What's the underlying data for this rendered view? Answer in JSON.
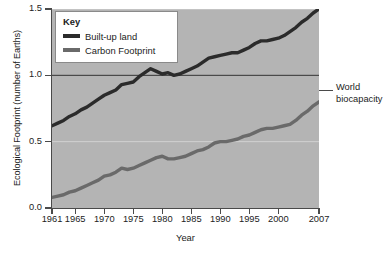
{
  "chart_data": {
    "type": "line",
    "title": "",
    "xlabel": "Year",
    "ylabel": "Ecological Footprint (number of Earths)",
    "xlim": [
      1961,
      2007
    ],
    "ylim": [
      0.0,
      1.5
    ],
    "grid": true,
    "legend_position": "top-left",
    "legend_title": "Key",
    "y_ticks": [
      "0.0",
      "0.5",
      "1.0",
      "1.5"
    ],
    "y_tick_values": [
      0.0,
      0.5,
      1.0,
      1.5
    ],
    "x_ticks": [
      "1961",
      "1965",
      "1970",
      "1975",
      "1980",
      "1985",
      "1990",
      "1995",
      "2000",
      "2007"
    ],
    "x_tick_values": [
      1961,
      1965,
      1970,
      1975,
      1980,
      1985,
      1990,
      1995,
      2000,
      2007
    ],
    "annotations": [
      {
        "text": "World biocapacity",
        "line1": "World",
        "line2": "biocapacity",
        "y_value": 1.0,
        "type": "horizontal-reference-line"
      }
    ],
    "x": [
      1961,
      1962,
      1963,
      1964,
      1965,
      1966,
      1967,
      1968,
      1969,
      1970,
      1971,
      1972,
      1973,
      1974,
      1975,
      1976,
      1977,
      1978,
      1979,
      1980,
      1981,
      1982,
      1983,
      1984,
      1985,
      1986,
      1987,
      1988,
      1989,
      1990,
      1991,
      1992,
      1993,
      1994,
      1995,
      1996,
      1997,
      1998,
      1999,
      2000,
      2001,
      2002,
      2003,
      2004,
      2005,
      2006,
      2007
    ],
    "series": [
      {
        "name": "Built-up land",
        "color": "#2b2b2b",
        "values": [
          0.62,
          0.64,
          0.66,
          0.69,
          0.71,
          0.74,
          0.76,
          0.79,
          0.82,
          0.85,
          0.87,
          0.89,
          0.93,
          0.94,
          0.95,
          0.99,
          1.02,
          1.05,
          1.03,
          1.01,
          1.02,
          1.0,
          1.01,
          1.03,
          1.05,
          1.07,
          1.1,
          1.13,
          1.14,
          1.15,
          1.16,
          1.17,
          1.17,
          1.19,
          1.21,
          1.24,
          1.26,
          1.26,
          1.27,
          1.28,
          1.3,
          1.33,
          1.36,
          1.4,
          1.43,
          1.47,
          1.5
        ]
      },
      {
        "name": "Carbon Footprint",
        "color": "#6a6a6a",
        "values": [
          0.08,
          0.09,
          0.1,
          0.12,
          0.13,
          0.15,
          0.17,
          0.19,
          0.21,
          0.24,
          0.25,
          0.27,
          0.3,
          0.29,
          0.3,
          0.32,
          0.34,
          0.36,
          0.38,
          0.39,
          0.37,
          0.37,
          0.38,
          0.39,
          0.41,
          0.43,
          0.44,
          0.46,
          0.49,
          0.5,
          0.5,
          0.51,
          0.52,
          0.54,
          0.55,
          0.57,
          0.59,
          0.6,
          0.6,
          0.61,
          0.62,
          0.63,
          0.66,
          0.7,
          0.73,
          0.77,
          0.8
        ]
      }
    ]
  },
  "axes": {
    "y_title": "Ecological Footprint (number of Earths)",
    "x_title": "Year"
  },
  "legend": {
    "title": "Key",
    "items": [
      {
        "label": "Built-up land"
      },
      {
        "label": "Carbon Footprint"
      }
    ]
  },
  "annotation": {
    "line1": "World",
    "line2": "biocapacity"
  },
  "colors": {
    "plot_background": "#b4b4b4",
    "axis": "#4a4a4a",
    "gridline": "#d2d2d2",
    "reference_line": "#4a4a4a",
    "series_built_up_land": "#2b2b2b",
    "series_carbon_footprint": "#6a6a6a"
  }
}
